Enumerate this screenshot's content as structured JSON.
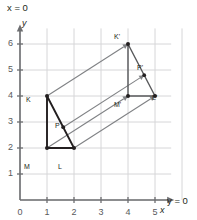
{
  "figure": {
    "title_annotations": {
      "x_axis_equation": "x = 0",
      "y_axis_equation": "y = 0"
    },
    "axes": {
      "x_label": "x",
      "y_label": "y",
      "x_ticks": [
        "0",
        "1",
        "2",
        "3",
        "4",
        "5"
      ],
      "y_ticks": [
        "0",
        "1",
        "2",
        "3",
        "4",
        "5",
        "6"
      ],
      "x_range": [
        0,
        5.6
      ],
      "y_range": [
        0,
        6.6
      ],
      "grid": true,
      "grid_color": "#d6d6d8",
      "axis_color": "#6d6e71"
    },
    "colors": {
      "preimage_stroke": "#231f20",
      "image_stroke": "#58595b",
      "vector_stroke": "#808285",
      "vertex_fill": "#231f20",
      "background": "#ffffff"
    },
    "shapes": [
      {
        "name": "preimage-triangle-klm",
        "kind": "triangle",
        "vertices": [
          {
            "label": "K",
            "x": 1,
            "y": 4
          },
          {
            "label": "L",
            "x": 2,
            "y": 2
          },
          {
            "label": "M",
            "x": 1,
            "y": 2
          }
        ],
        "interior_point": {
          "label": "P",
          "x": 1.6,
          "y": 2.8
        }
      },
      {
        "name": "image-triangle-k-prime",
        "kind": "triangle",
        "vertices": [
          {
            "label": "K'",
            "x": 4,
            "y": 6
          },
          {
            "label": "L'",
            "x": 5,
            "y": 4
          },
          {
            "label": "M'",
            "x": 4,
            "y": 4
          }
        ],
        "interior_point": {
          "label": "P'",
          "x": 4.6,
          "y": 4.8
        }
      }
    ],
    "translation_vectors": [
      {
        "name": "vector-k-to-k-prime",
        "from": {
          "x": 1,
          "y": 4
        },
        "to": {
          "x": 4,
          "y": 6
        }
      },
      {
        "name": "vector-l-to-l-prime",
        "from": {
          "x": 2,
          "y": 2
        },
        "to": {
          "x": 5,
          "y": 4
        }
      },
      {
        "name": "vector-m-to-m-prime",
        "from": {
          "x": 1,
          "y": 2
        },
        "to": {
          "x": 4,
          "y": 4
        }
      },
      {
        "name": "vector-p-to-p-prime",
        "from": {
          "x": 1.6,
          "y": 2.8
        },
        "to": {
          "x": 4.6,
          "y": 4.8
        }
      }
    ],
    "point_labels": [
      {
        "name": "point-label-k",
        "text": "K",
        "left": 26,
        "top": 96
      },
      {
        "name": "point-label-l",
        "text": "L",
        "left": 58,
        "top": 163
      },
      {
        "name": "point-label-m",
        "text": "M",
        "left": 24,
        "top": 163
      },
      {
        "name": "point-label-p",
        "text": "P",
        "left": 55,
        "top": 122
      },
      {
        "name": "point-label-k-prime",
        "text": "K'",
        "left": 114,
        "top": 33
      },
      {
        "name": "point-label-l-prime",
        "text": "L'",
        "left": 152,
        "top": 94
      },
      {
        "name": "point-label-m-prime",
        "text": "M'",
        "left": 114,
        "top": 101
      },
      {
        "name": "point-label-p-prime",
        "text": "P'",
        "left": 137,
        "top": 64
      }
    ]
  }
}
